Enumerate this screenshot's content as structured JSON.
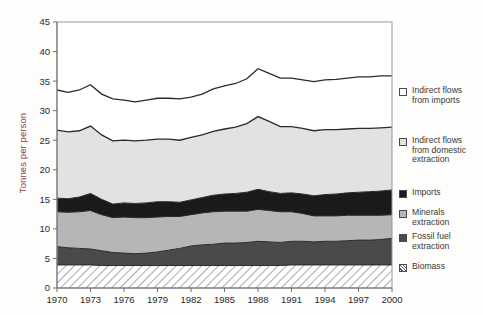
{
  "chart_data": {
    "type": "area",
    "title": "",
    "subtitle": "",
    "xlabel": "",
    "ylabel": "Tonnes per person",
    "ylim": [
      0,
      45
    ],
    "yticks": [
      0,
      5,
      10,
      15,
      20,
      25,
      30,
      35,
      40,
      45
    ],
    "xlim": [
      1970,
      2000
    ],
    "xticks": [
      1970,
      1973,
      1976,
      1979,
      1982,
      1985,
      1988,
      1991,
      1994,
      1997,
      2000
    ],
    "grid": false,
    "legend_position": "right",
    "stacked": true,
    "stack_order_bottom_to_top": [
      "Biomass",
      "Fossil fuel extraction",
      "Minerals extraction",
      "Imports",
      "Indirect flows from domestic extraction",
      "Indirect flows from imports"
    ],
    "x": [
      1970,
      1971,
      1972,
      1973,
      1974,
      1975,
      1976,
      1977,
      1978,
      1979,
      1980,
      1981,
      1982,
      1983,
      1984,
      1985,
      1986,
      1987,
      1988,
      1989,
      1990,
      1991,
      1992,
      1993,
      1994,
      1995,
      1996,
      1997,
      1998,
      1999,
      2000
    ],
    "series": [
      {
        "name": "Biomass",
        "color": "#ffffff",
        "pattern": "diagonal-hatch",
        "values": [
          3.9,
          3.9,
          3.9,
          3.9,
          3.8,
          3.8,
          3.8,
          3.8,
          3.8,
          3.8,
          3.8,
          3.8,
          3.8,
          3.8,
          3.8,
          3.8,
          3.8,
          3.8,
          3.8,
          3.8,
          3.8,
          3.9,
          3.9,
          3.9,
          3.9,
          3.9,
          3.9,
          3.9,
          3.9,
          3.9,
          3.9
        ]
      },
      {
        "name": "Fossil fuel extraction",
        "color": "#4a4a4a",
        "values": [
          3.1,
          2.9,
          2.8,
          2.7,
          2.5,
          2.2,
          2.1,
          2.0,
          2.1,
          2.3,
          2.6,
          2.9,
          3.3,
          3.5,
          3.6,
          3.8,
          3.8,
          3.9,
          4.1,
          4.0,
          3.9,
          4.0,
          4.0,
          3.9,
          4.0,
          4.0,
          4.1,
          4.2,
          4.2,
          4.3,
          4.5
        ]
      },
      {
        "name": "Minerals extraction",
        "color": "#b6b6b6",
        "values": [
          5.9,
          6.0,
          6.2,
          6.5,
          6.1,
          5.9,
          6.1,
          6.1,
          6.0,
          5.9,
          5.7,
          5.4,
          5.3,
          5.4,
          5.5,
          5.4,
          5.4,
          5.3,
          5.4,
          5.3,
          5.2,
          5.0,
          4.7,
          4.4,
          4.3,
          4.3,
          4.3,
          4.2,
          4.2,
          4.1,
          4.0
        ]
      },
      {
        "name": "Imports",
        "color": "#1a1a1a",
        "values": [
          2.3,
          2.3,
          2.5,
          2.9,
          2.6,
          2.3,
          2.4,
          2.4,
          2.5,
          2.6,
          2.5,
          2.4,
          2.5,
          2.6,
          2.8,
          2.9,
          3.0,
          3.2,
          3.4,
          3.2,
          3.1,
          3.2,
          3.3,
          3.4,
          3.6,
          3.7,
          3.8,
          3.9,
          4.0,
          4.1,
          4.2
        ]
      },
      {
        "name": "Indirect flows from domestic extraction",
        "color": "#e2e2e0",
        "values": [
          11.5,
          11.3,
          11.2,
          11.4,
          10.9,
          10.7,
          10.6,
          10.6,
          10.6,
          10.6,
          10.6,
          10.5,
          10.6,
          10.6,
          10.8,
          11.0,
          11.2,
          11.6,
          12.3,
          11.9,
          11.3,
          11.2,
          11.1,
          11.0,
          11.0,
          10.9,
          10.8,
          10.8,
          10.7,
          10.7,
          10.6
        ]
      },
      {
        "name": "Indirect flows from imports",
        "color": "#ffffff",
        "values": [
          6.8,
          6.7,
          6.9,
          7.0,
          6.9,
          7.1,
          6.8,
          6.6,
          6.8,
          6.9,
          6.9,
          7.0,
          6.8,
          6.9,
          7.2,
          7.3,
          7.4,
          7.6,
          8.1,
          8.1,
          8.2,
          8.2,
          8.2,
          8.3,
          8.4,
          8.5,
          8.6,
          8.7,
          8.7,
          8.8,
          8.7
        ]
      }
    ],
    "totals": [
      33.5,
      33.1,
      33.5,
      34.4,
      32.8,
      32.0,
      31.8,
      31.5,
      31.8,
      32.1,
      32.1,
      32.0,
      32.3,
      32.8,
      33.7,
      34.2,
      34.6,
      35.4,
      37.1,
      36.3,
      35.5,
      35.5,
      35.2,
      34.9,
      35.2,
      35.3,
      35.5,
      35.7,
      35.7,
      35.9,
      35.9
    ]
  },
  "axes": {
    "ylabel": "Tonnes per person",
    "ytick_labels": [
      "0",
      "5",
      "10",
      "15",
      "20",
      "25",
      "30",
      "35",
      "40",
      "45"
    ],
    "xtick_labels": [
      "1970",
      "1973",
      "1976",
      "1979",
      "1982",
      "1985",
      "1988",
      "1991",
      "1994",
      "1997",
      "2000"
    ]
  },
  "legend": {
    "items": [
      {
        "label": "Indirect flows\nfrom imports",
        "swatch": "white-square-swatch",
        "color": "#ffffff"
      },
      {
        "label": "Indirect flows\nfrom domestic\nextraction",
        "swatch": "light-gray-square-swatch",
        "color": "#e2e2e0"
      },
      {
        "label": "Imports",
        "swatch": "black-square-swatch",
        "color": "#1a1a1a"
      },
      {
        "label": "Minerals\nextraction",
        "swatch": "gray-square-swatch",
        "color": "#b6b6b6"
      },
      {
        "label": "Fossil fuel\nextraction",
        "swatch": "dark-gray-square-swatch",
        "color": "#4a4a4a"
      },
      {
        "label": "Biomass",
        "swatch": "hatched-square-swatch",
        "color": "#ffffff"
      }
    ]
  },
  "colors": {
    "axis": "#6e6e6e",
    "plot_border": "#9a9a9a",
    "ylabel_text": "#8c3b46",
    "line": "#2a2a2a"
  }
}
